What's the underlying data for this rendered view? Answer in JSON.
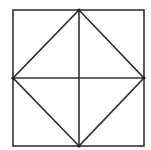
{
  "diagram": {
    "type": "geometric-figure",
    "canvas": {
      "width": 151,
      "height": 150
    },
    "colors": {
      "background": "#ffffff",
      "stroke": "#333333",
      "vertex": "#222222"
    },
    "stroke_width": 1.6,
    "square": {
      "x1": 13,
      "y1": 10,
      "x2": 144,
      "y2": 146
    },
    "vertices": {
      "top": {
        "x": 79,
        "y": 10
      },
      "right": {
        "x": 144,
        "y": 78
      },
      "bottom": {
        "x": 79,
        "y": 146
      },
      "left": {
        "x": 13,
        "y": 78
      }
    },
    "segments": [
      {
        "name": "diamond-top-right",
        "from": "top",
        "to": "right"
      },
      {
        "name": "diamond-right-bottom",
        "from": "right",
        "to": "bottom"
      },
      {
        "name": "diamond-bottom-left",
        "from": "bottom",
        "to": "left"
      },
      {
        "name": "diamond-left-top",
        "from": "left",
        "to": "top"
      },
      {
        "name": "vertical-center-line",
        "from": "top",
        "to": "bottom"
      },
      {
        "name": "horizontal-center-line",
        "from": "left",
        "to": "right"
      }
    ]
  }
}
